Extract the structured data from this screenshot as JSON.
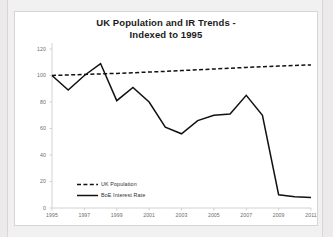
{
  "chart_data": {
    "type": "line",
    "title": "UK Population and IR Trends - Indexed to 1995",
    "title_line1": "UK Population and IR Trends -",
    "title_line2": "Indexed to 1995",
    "xlabel": "",
    "ylabel": "",
    "grid": false,
    "legend_position": "inside-lower-left",
    "xlim": [
      1995,
      2011
    ],
    "ylim": [
      0,
      120
    ],
    "ytick_values": [
      0,
      20,
      40,
      60,
      80,
      100,
      120
    ],
    "ytick_labels": [
      "0",
      "20",
      "40",
      "60",
      "80",
      "100",
      "120"
    ],
    "xtick_values": [
      1995,
      1997,
      1999,
      2001,
      2003,
      2005,
      2007,
      2009,
      2011
    ],
    "xtick_labels": [
      "1995",
      "1997",
      "1999",
      "2001",
      "2003",
      "2005",
      "2007",
      "2009",
      "2011"
    ],
    "x": [
      1995,
      1996,
      1997,
      1998,
      1999,
      2000,
      2001,
      2002,
      2003,
      2004,
      2005,
      2006,
      2007,
      2008,
      2009,
      2010,
      2011
    ],
    "series": [
      {
        "name": "UK Population",
        "style": "dashed",
        "color": "#111111",
        "values": [
          100,
          100.4,
          100.8,
          101.2,
          101.6,
          102.1,
          102.6,
          103.1,
          103.7,
          104.3,
          104.9,
          105.5,
          106.1,
          106.6,
          107.1,
          107.6,
          108.0
        ]
      },
      {
        "name": "BoE Interest Rate",
        "style": "solid",
        "color": "#111111",
        "values": [
          100,
          89,
          100,
          109,
          81,
          91,
          80,
          61,
          56,
          66,
          70,
          71,
          85,
          70,
          10,
          8.5,
          8
        ]
      }
    ],
    "legend_entries": [
      "UK Population",
      "BoE Interest Rate"
    ]
  },
  "colors": {
    "page_background": "#eceaea",
    "frame_background": "#f2f1f1",
    "plot_background": "#ffffff",
    "plot_border": "#d6d4d4",
    "axis": "#c9c7c7",
    "tick_text": "#6e6c6c",
    "title_text": "#1b1b1b",
    "series_line": "#111111"
  }
}
